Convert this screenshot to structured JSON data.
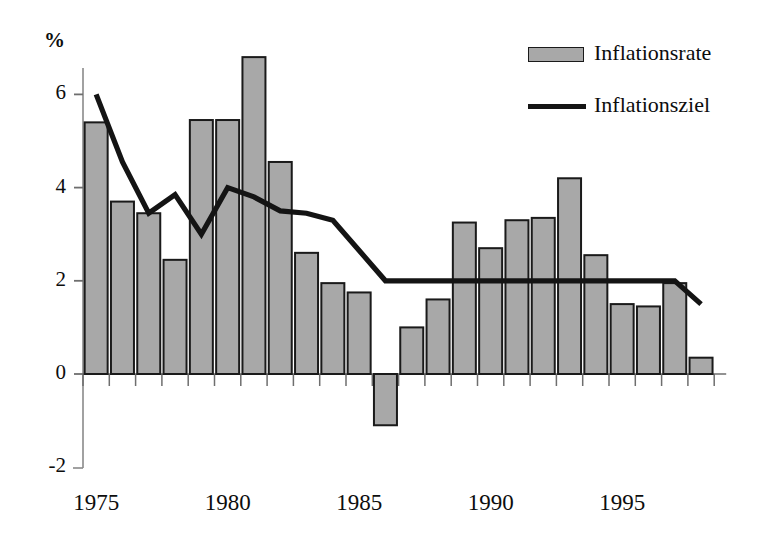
{
  "chart_data": {
    "type": "bar",
    "title": "",
    "xlabel": "",
    "ylabel": "%",
    "ylim": [
      -2,
      7.4
    ],
    "xlim": [
      1974.5,
      1998.5
    ],
    "grid": false,
    "legend_position": "top-right",
    "y_ticks": [
      "6",
      "4",
      "2",
      "0",
      "-2"
    ],
    "y_tick_values": [
      6,
      4,
      2,
      0,
      -2
    ],
    "x_ticks": [
      "1975",
      "1980",
      "1985",
      "1990",
      "1995"
    ],
    "x_tick_values": [
      1975,
      1980,
      1985,
      1990,
      1995
    ],
    "categories": [
      1975,
      1976,
      1977,
      1978,
      1979,
      1980,
      1981,
      1982,
      1983,
      1984,
      1985,
      1986,
      1987,
      1988,
      1989,
      1990,
      1991,
      1992,
      1993,
      1994,
      1995,
      1996,
      1997,
      1998
    ],
    "series": [
      {
        "name": "Inflationsrate",
        "type": "bar",
        "color": "#a8a8a8",
        "edge_color": "#1a1a1a",
        "values": [
          5.4,
          3.7,
          3.45,
          2.45,
          5.45,
          5.45,
          6.8,
          4.55,
          2.6,
          1.95,
          1.75,
          -1.1,
          1.0,
          1.6,
          3.25,
          2.7,
          3.3,
          3.35,
          4.2,
          2.55,
          1.5,
          1.45,
          1.95,
          0.35
        ]
      },
      {
        "name": "Inflationsziel",
        "type": "line",
        "color": "#141414",
        "values": [
          6.0,
          4.55,
          3.45,
          3.85,
          3.0,
          4.0,
          3.8,
          3.5,
          3.45,
          3.3,
          2.65,
          2.0,
          2.0,
          2.0,
          2.0,
          2.0,
          2.0,
          2.0,
          2.0,
          2.0,
          2.0,
          2.0,
          2.0,
          1.5
        ]
      }
    ]
  },
  "legend": {
    "items": [
      {
        "label": "Inflationsrate",
        "marker": "bar-swatch"
      },
      {
        "label": "Inflationsziel",
        "marker": "line-swatch"
      }
    ]
  },
  "axis": {
    "y_unit_label": "%"
  }
}
